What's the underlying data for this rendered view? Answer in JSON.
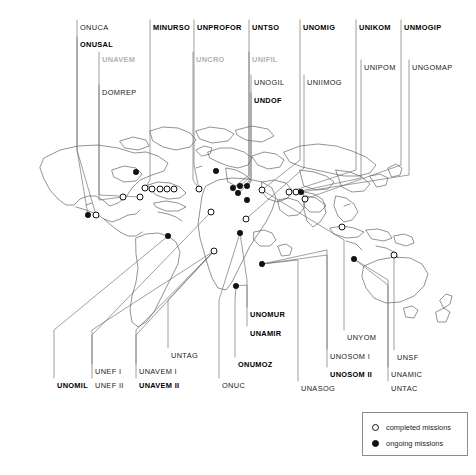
{
  "figure": {
    "width": 476,
    "height": 475,
    "background": "#ffffff",
    "line_color": "#555555",
    "coast_color": "#444444"
  },
  "legend": {
    "items": [
      {
        "marker": "hollow-circle",
        "label": "completed missions"
      },
      {
        "marker": "filled-circle",
        "label": "ongoing missions"
      }
    ]
  },
  "labels": {
    "top": [
      {
        "id": "onuca",
        "text": "ONUCA",
        "weight": "regular",
        "faded": "none",
        "x": 80,
        "y": 24
      },
      {
        "id": "onusal",
        "text": "ONUSAL",
        "weight": "bold",
        "faded": "none",
        "x": 80,
        "y": 41
      },
      {
        "id": "unavem",
        "text": "UNAVEM",
        "weight": "bold",
        "faded": "heavy",
        "x": 102,
        "y": 56
      },
      {
        "id": "domrep",
        "text": "DOMREP",
        "weight": "regular",
        "faded": "none",
        "x": 102,
        "y": 89
      },
      {
        "id": "minurso",
        "text": "MINURSO",
        "weight": "bold",
        "faded": "none",
        "x": 153,
        "y": 24
      },
      {
        "id": "unprofor",
        "text": "UNPROFOR",
        "weight": "bold",
        "faded": "none",
        "x": 197,
        "y": 24
      },
      {
        "id": "uncro",
        "text": "UNCRO",
        "weight": "bold",
        "faded": "heavy",
        "x": 196,
        "y": 56
      },
      {
        "id": "untso",
        "text": "UNTSO",
        "weight": "bold",
        "faded": "none",
        "x": 252,
        "y": 24
      },
      {
        "id": "unifil",
        "text": "UNIFIL",
        "weight": "bold",
        "faded": "heavy",
        "x": 252,
        "y": 56
      },
      {
        "id": "unogil",
        "text": "UNOGIL",
        "weight": "regular",
        "faded": "none",
        "x": 254,
        "y": 79
      },
      {
        "id": "undof",
        "text": "UNDOF",
        "weight": "bold",
        "faded": "none",
        "x": 254,
        "y": 97
      },
      {
        "id": "unomig",
        "text": "UNOMIG",
        "weight": "bold",
        "faded": "none",
        "x": 303,
        "y": 24
      },
      {
        "id": "uniimog",
        "text": "UNIIMOG",
        "weight": "regular",
        "faded": "none",
        "x": 307,
        "y": 79
      },
      {
        "id": "unikom",
        "text": "UNIKOM",
        "weight": "bold",
        "faded": "none",
        "x": 359,
        "y": 24
      },
      {
        "id": "unipom",
        "text": "UNIPOM",
        "weight": "regular",
        "faded": "none",
        "x": 364,
        "y": 64
      },
      {
        "id": "unmogip",
        "text": "UNMOGIP",
        "weight": "bold",
        "faded": "none",
        "x": 404,
        "y": 24
      },
      {
        "id": "ungomap",
        "text": "UNGOMAP",
        "weight": "regular",
        "faded": "none",
        "x": 412,
        "y": 64
      }
    ],
    "bottom": [
      {
        "id": "unomil",
        "text": "UNOMIL",
        "weight": "bold",
        "faded": "none",
        "x": 57,
        "y": 382
      },
      {
        "id": "unef1",
        "text": "UNEF I",
        "weight": "regular",
        "faded": "none",
        "x": 95,
        "y": 368
      },
      {
        "id": "unef2",
        "text": "UNEF II",
        "weight": "regular",
        "faded": "none",
        "x": 95,
        "y": 382
      },
      {
        "id": "unavem1",
        "text": "UNAVEM I",
        "weight": "regular",
        "faded": "none",
        "x": 139,
        "y": 368
      },
      {
        "id": "unavem2",
        "text": "UNAVEM II",
        "weight": "bold",
        "faded": "none",
        "x": 139,
        "y": 382
      },
      {
        "id": "untag",
        "text": "UNTAG",
        "weight": "regular",
        "faded": "none",
        "x": 171,
        "y": 352
      },
      {
        "id": "onuc",
        "text": "ONUC",
        "weight": "regular",
        "faded": "none",
        "x": 222,
        "y": 382
      },
      {
        "id": "unomur",
        "text": "UNOMUR",
        "weight": "bold",
        "faded": "none",
        "x": 250,
        "y": 311
      },
      {
        "id": "unamir",
        "text": "UNAMIR",
        "weight": "bold",
        "faded": "none",
        "x": 250,
        "y": 330
      },
      {
        "id": "onumoz",
        "text": "ONUMOZ",
        "weight": "bold",
        "faded": "none",
        "x": 238,
        "y": 361
      },
      {
        "id": "unyom",
        "text": "UNYOM",
        "weight": "regular",
        "faded": "none",
        "x": 347,
        "y": 334
      },
      {
        "id": "unosom1",
        "text": "UNOSOM I",
        "weight": "regular",
        "faded": "none",
        "x": 330,
        "y": 353
      },
      {
        "id": "unosom2",
        "text": "UNOSOM II",
        "weight": "bold",
        "faded": "none",
        "x": 330,
        "y": 371
      },
      {
        "id": "unasog",
        "text": "UNASOG",
        "weight": "regular",
        "faded": "none",
        "x": 301,
        "y": 385
      },
      {
        "id": "unsf",
        "text": "UNSF",
        "weight": "regular",
        "faded": "none",
        "x": 397,
        "y": 354
      },
      {
        "id": "unamic",
        "text": "UNAMIC",
        "weight": "regular",
        "faded": "none",
        "x": 391,
        "y": 371
      },
      {
        "id": "untac",
        "text": "UNTAC",
        "weight": "regular",
        "faded": "none",
        "x": 391,
        "y": 385
      }
    ]
  },
  "markers": {
    "completed": [
      {
        "id": "m-c1",
        "x": 199,
        "y": 189
      },
      {
        "id": "m-c2",
        "x": 96,
        "y": 215
      },
      {
        "id": "m-c3",
        "x": 145,
        "y": 188
      },
      {
        "id": "m-c4",
        "x": 152,
        "y": 189
      },
      {
        "id": "m-c5",
        "x": 160,
        "y": 189
      },
      {
        "id": "m-c6",
        "x": 167,
        "y": 189
      },
      {
        "id": "m-c7",
        "x": 174,
        "y": 189
      },
      {
        "id": "m-c8",
        "x": 140,
        "y": 197
      },
      {
        "id": "m-c9",
        "x": 211,
        "y": 212
      },
      {
        "id": "m-c10",
        "x": 214,
        "y": 251
      },
      {
        "id": "m-c11",
        "x": 246,
        "y": 219
      },
      {
        "id": "m-c12",
        "x": 262,
        "y": 190
      },
      {
        "id": "m-c13",
        "x": 289,
        "y": 192
      },
      {
        "id": "m-c14",
        "x": 296,
        "y": 192
      },
      {
        "id": "m-c15",
        "x": 305,
        "y": 199
      },
      {
        "id": "m-c16",
        "x": 342,
        "y": 227
      },
      {
        "id": "m-c17",
        "x": 394,
        "y": 255
      },
      {
        "id": "m-c18",
        "x": 123,
        "y": 197
      }
    ],
    "ongoing": [
      {
        "id": "m-o1",
        "x": 88,
        "y": 215
      },
      {
        "id": "m-o2",
        "x": 136,
        "y": 172
      },
      {
        "id": "m-o3",
        "x": 216,
        "y": 171
      },
      {
        "id": "m-o4",
        "x": 247,
        "y": 200
      },
      {
        "id": "m-o5",
        "x": 233,
        "y": 188
      },
      {
        "id": "m-o6",
        "x": 240,
        "y": 186
      },
      {
        "id": "m-o7",
        "x": 247,
        "y": 186
      },
      {
        "id": "m-o8",
        "x": 238,
        "y": 193
      },
      {
        "id": "m-o9",
        "x": 301,
        "y": 192
      },
      {
        "id": "m-o10",
        "x": 240,
        "y": 233
      },
      {
        "id": "m-o11",
        "x": 262,
        "y": 264
      },
      {
        "id": "m-o12",
        "x": 236,
        "y": 286
      },
      {
        "id": "m-o13",
        "x": 168,
        "y": 236
      },
      {
        "id": "m-o14",
        "x": 354,
        "y": 259
      }
    ]
  }
}
